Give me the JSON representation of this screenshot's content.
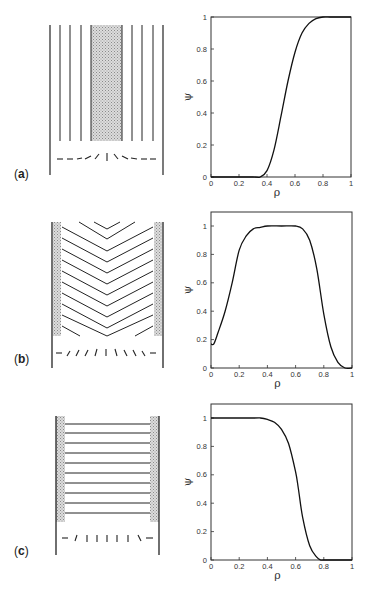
{
  "panels": [
    {
      "label_open": "(",
      "label_letter": "a",
      "label_close": ")"
    },
    {
      "label_open": "(",
      "label_letter": "b",
      "label_close": ")"
    },
    {
      "label_open": "(",
      "label_letter": "c",
      "label_close": ")"
    }
  ],
  "axes": {
    "xlabel": "ρ",
    "ylabel": "ψ",
    "xticks": [
      "0",
      "0.2",
      "0.4",
      "0.6",
      "0.8",
      "1"
    ],
    "yticks": [
      "0",
      "0.2",
      "0.4",
      "0.6",
      "0.8",
      "1"
    ]
  },
  "chart_data": [
    {
      "type": "line",
      "panel": "a",
      "xlabel": "ρ",
      "ylabel": "ψ",
      "xlim": [
        0,
        1
      ],
      "ylim": [
        0,
        1
      ],
      "grid": false,
      "x": [
        0,
        0.3,
        0.35,
        0.4,
        0.45,
        0.5,
        0.55,
        0.6,
        0.65,
        0.7,
        0.75,
        0.8,
        0.85,
        0.9,
        1.0
      ],
      "values": [
        0,
        0,
        0.0,
        0.04,
        0.17,
        0.38,
        0.6,
        0.78,
        0.9,
        0.96,
        0.99,
        1.0,
        1.0,
        1.0,
        1.0
      ]
    },
    {
      "type": "line",
      "panel": "b",
      "xlabel": "ρ",
      "ylabel": "ψ",
      "xlim": [
        0,
        1
      ],
      "ylim": [
        0,
        1.1
      ],
      "grid": false,
      "x": [
        0,
        0.02,
        0.05,
        0.1,
        0.15,
        0.2,
        0.25,
        0.3,
        0.35,
        0.4,
        0.5,
        0.6,
        0.65,
        0.7,
        0.75,
        0.8,
        0.85,
        0.9,
        0.95,
        1.0
      ],
      "values": [
        0.17,
        0.17,
        0.25,
        0.4,
        0.6,
        0.83,
        0.93,
        0.98,
        0.99,
        1.0,
        1.0,
        1.0,
        0.98,
        0.9,
        0.7,
        0.38,
        0.15,
        0.04,
        0.0,
        0.0
      ]
    },
    {
      "type": "line",
      "panel": "c",
      "xlabel": "ρ",
      "ylabel": "ψ",
      "xlim": [
        0,
        1
      ],
      "ylim": [
        0,
        1.1
      ],
      "grid": false,
      "x": [
        0,
        0.3,
        0.35,
        0.4,
        0.45,
        0.5,
        0.55,
        0.6,
        0.62,
        0.65,
        0.7,
        0.75,
        0.78,
        0.8,
        1.0
      ],
      "values": [
        1.0,
        1.0,
        1.0,
        0.99,
        0.97,
        0.92,
        0.82,
        0.62,
        0.5,
        0.3,
        0.1,
        0.02,
        0.0,
        0.0,
        0.0
      ]
    }
  ]
}
